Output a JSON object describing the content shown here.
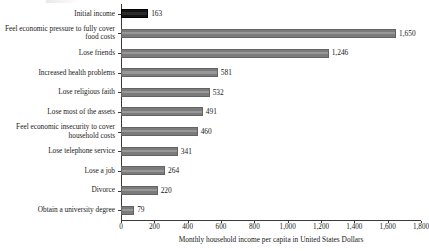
{
  "chart_data": {
    "type": "bar",
    "orientation": "horizontal",
    "title": "",
    "xlabel": "Monthly household income per capita in United States Dollars",
    "ylabel": "",
    "xlim": [
      0,
      1800
    ],
    "xticks": [
      "0",
      "200",
      "400",
      "600",
      "800",
      "1,000",
      "1,200",
      "1,400",
      "1,600",
      "1,800"
    ],
    "xtick_values": [
      0,
      200,
      400,
      600,
      800,
      1000,
      1200,
      1400,
      1600,
      1800
    ],
    "grid": false,
    "legend": false,
    "categories": [
      "Initial income",
      "Feel economic pressure to fully cover\nfood costs",
      "Lose friends",
      "Increased health problems",
      "Lose religious faith",
      "Lose most of the assets",
      "Feel economic insecurity to cover\nhousehold costs",
      "Lose telephone service",
      "Lose a job",
      "Divorce",
      "Obtain a university degree"
    ],
    "values": [
      163,
      1650,
      1246,
      581,
      532,
      491,
      460,
      341,
      264,
      220,
      79
    ],
    "value_labels": [
      "163",
      "1,650",
      "1,246",
      "581",
      "532",
      "491",
      "460",
      "341",
      "264",
      "220",
      "79"
    ],
    "bar_colors": [
      "#141414",
      "#7b7b7b",
      "#7b7b7b",
      "#7b7b7b",
      "#7b7b7b",
      "#7b7b7b",
      "#7b7b7b",
      "#7b7b7b",
      "#7b7b7b",
      "#7b7b7b",
      "#7b7b7b"
    ],
    "highlight_color": "#141414",
    "series_color": "#7b7b7b"
  }
}
